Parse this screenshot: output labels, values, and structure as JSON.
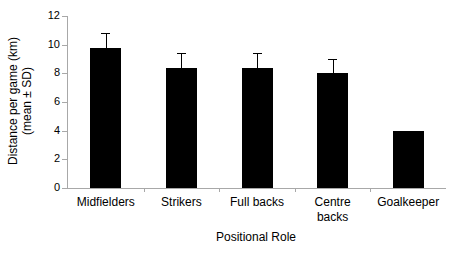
{
  "chart_data": {
    "type": "bar",
    "title": "",
    "xlabel": "Positional Role",
    "ylabel_lines": [
      "Distance per game (km)",
      "(mean ± SD)"
    ],
    "categories": [
      "Midfielders",
      "Strikers",
      "Full backs",
      "Centre backs",
      "Goalkeeper"
    ],
    "category_label_lines": [
      [
        "Midfielders"
      ],
      [
        "Strikers"
      ],
      [
        "Full backs"
      ],
      [
        "Centre",
        "backs"
      ],
      [
        "Goalkeeper"
      ]
    ],
    "values": [
      9.8,
      8.4,
      8.4,
      8.0,
      4.0
    ],
    "error_sd": [
      1.0,
      1.0,
      1.0,
      1.0,
      0
    ],
    "ylim": [
      0,
      12
    ],
    "yticks": [
      0,
      2,
      4,
      6,
      8,
      10,
      12
    ],
    "grid": false,
    "legend": "none",
    "bar_color": "#000000",
    "axis_color": "#a8a8a8",
    "background_color": "#ffffff"
  }
}
